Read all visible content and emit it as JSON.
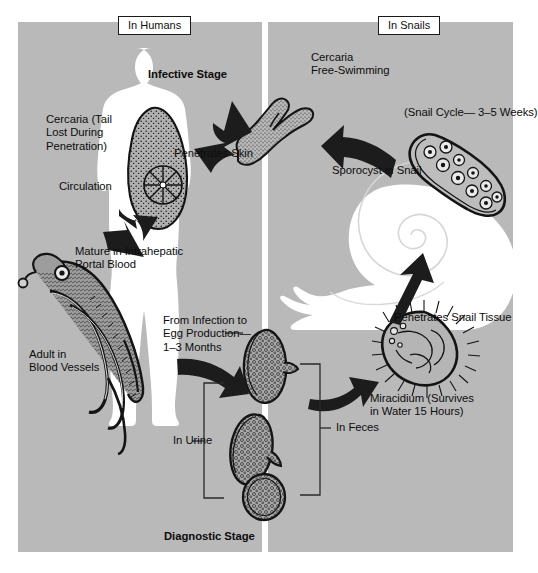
{
  "figure": {
    "background_color": "#ffffff",
    "panel_color": "#b9b9b9",
    "ink_color": "#0d0d0d"
  },
  "panels": {
    "humans": {
      "title": "In Humans"
    },
    "snails": {
      "title": "In Snails"
    }
  },
  "labels": {
    "infective_stage": "Infective Stage",
    "cercaria_tail_lost": "Cercaria (Tail\nLost During\nPenetration)",
    "penetrates_skin": "Penetrates Skin",
    "circulation": "Circulation",
    "mature_portal": "Mature in Intrahepatic\nPortal Blood",
    "adult_blood_vessels": "Adult in\nBlood Vessels",
    "infection_to_egg": "From Infection to\nEgg Production—\n1–3 Months",
    "in_urine": "In Urine",
    "in_feces": "In Feces",
    "diagnostic_stage": "Diagnostic Stage",
    "cercaria_free_swimming": "Cercaria\nFree-Swimming",
    "snail_cycle": "(Snail Cycle— 3–5 Weeks)",
    "sporocyst_in_snail": "Sporocyst in Snail",
    "penetrates_snail_tissue": "Penetrates Snail Tissue",
    "miracidium": "Miracidium (Survives\nin Water 15 Hours)"
  },
  "organisms": {
    "cercaria_in_human": "cercaria-body-shape",
    "cercaria_free": "forked-tail-cercaria",
    "adult_worms": "paired-adult-schistosomes",
    "egg_terminal_spine": "egg-with-terminal-spine",
    "egg_lateral_spine": "egg-with-lateral-spine",
    "egg_round": "round-egg",
    "sporocyst": "sporocyst-with-germ-balls",
    "miracidium_shape": "ciliated-miracidium",
    "snail_shape": "spiral-shelled-snail",
    "human_shape": "human-body-silhouette"
  },
  "arrows": [
    {
      "name": "cercaria-to-skin",
      "from": "free-swimming cercaria",
      "to": "human skin"
    },
    {
      "name": "circulation-downward",
      "from": "skin",
      "to": "portal blood"
    },
    {
      "name": "adult-to-eggs",
      "from": "adult worms",
      "to": "eggs"
    },
    {
      "name": "eggs-to-miracidium",
      "from": "eggs",
      "to": "miracidium"
    },
    {
      "name": "miracidium-to-snail",
      "from": "miracidium",
      "to": "snail tissue"
    },
    {
      "name": "snail-to-cercaria",
      "from": "sporocyst",
      "to": "free-swimming cercaria"
    }
  ]
}
